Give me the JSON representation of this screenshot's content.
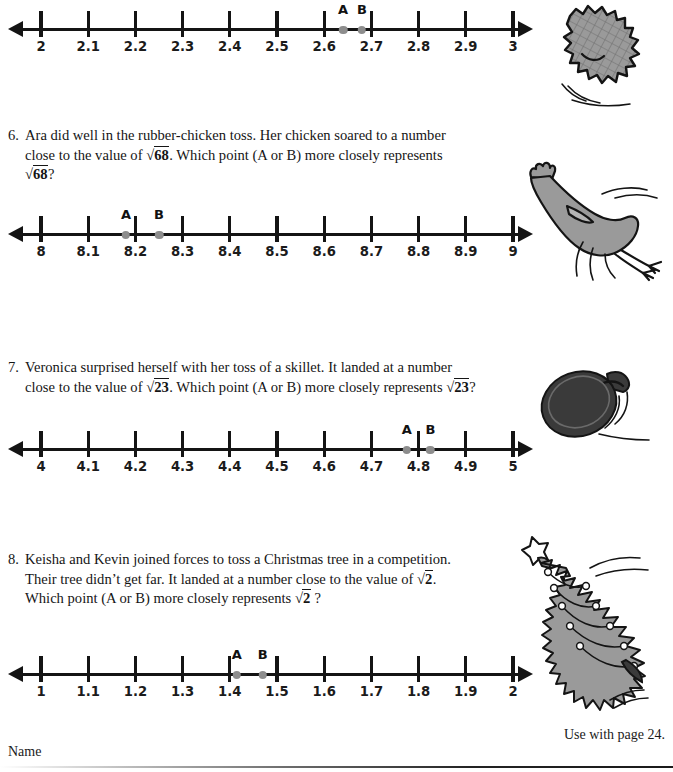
{
  "footer": {
    "name_label": "Name",
    "page_note": "Use with page 24."
  },
  "questions": [
    {
      "number": "6.",
      "lines": [
        "Ara did well in the rubber-chicken toss. Her chicken soared to a number",
        "close to the value of √68. Which point (A or B) more closely represents",
        "√68?"
      ],
      "radicand": "68",
      "illustration": "rubber-chicken"
    },
    {
      "number": "7.",
      "lines": [
        "Veronica surprised herself with her toss of a skillet. It landed at a number",
        "close to the value of √23. Which point (A or B) more closely represents √23?"
      ],
      "radicand": "23",
      "illustration": "skillet"
    },
    {
      "number": "8.",
      "lines": [
        "Keisha and Kevin joined forces to toss a Christmas tree in a competition.",
        "Their tree didn't get far. It landed at a number close to the value of √2.",
        "Which point (A or B) more closely represents √2?"
      ],
      "radicand": "2",
      "illustration": "christmas-tree"
    }
  ],
  "chart_data": [
    {
      "type": "numberline",
      "id": "numberline-1",
      "title": "",
      "min": 2,
      "max": 3,
      "step": 0.1,
      "tick_labels": [
        "2",
        "2.1",
        "2.2",
        "2.3",
        "2.4",
        "2.5",
        "2.6",
        "2.7",
        "2.8",
        "2.9",
        "3"
      ],
      "points": [
        {
          "label": "A",
          "value": 2.64
        },
        {
          "label": "B",
          "value": 2.68
        }
      ],
      "xlabel": "",
      "ylabel": "",
      "grid": false
    },
    {
      "type": "numberline",
      "id": "numberline-2",
      "title": "",
      "min": 8,
      "max": 9,
      "step": 0.1,
      "tick_labels": [
        "8",
        "8.1",
        "8.2",
        "8.3",
        "8.4",
        "8.5",
        "8.6",
        "8.7",
        "8.8",
        "8.9",
        "9"
      ],
      "points": [
        {
          "label": "A",
          "value": 8.18
        },
        {
          "label": "B",
          "value": 8.25
        }
      ],
      "xlabel": "",
      "ylabel": "",
      "grid": false
    },
    {
      "type": "numberline",
      "id": "numberline-3",
      "title": "",
      "min": 4,
      "max": 5,
      "step": 0.1,
      "tick_labels": [
        "4",
        "4.1",
        "4.2",
        "4.3",
        "4.4",
        "4.5",
        "4.6",
        "4.7",
        "4.8",
        "4.9",
        "5"
      ],
      "points": [
        {
          "label": "A",
          "value": 4.775
        },
        {
          "label": "B",
          "value": 4.825
        }
      ],
      "xlabel": "",
      "ylabel": "",
      "grid": false
    },
    {
      "type": "numberline",
      "id": "numberline-4",
      "title": "",
      "min": 1,
      "max": 2,
      "step": 0.1,
      "tick_labels": [
        "1",
        "1.1",
        "1.2",
        "1.3",
        "1.4",
        "1.5",
        "1.6",
        "1.7",
        "1.8",
        "1.9",
        "2"
      ],
      "points": [
        {
          "label": "A",
          "value": 1.415
        },
        {
          "label": "B",
          "value": 1.47
        }
      ],
      "xlabel": "",
      "ylabel": "",
      "grid": false
    }
  ],
  "colors": {
    "ink": "#141414",
    "point_gray": "#8d8d8d",
    "illustration_gray": "#9a9a9a",
    "illustration_dark": "#3a3a3a"
  }
}
